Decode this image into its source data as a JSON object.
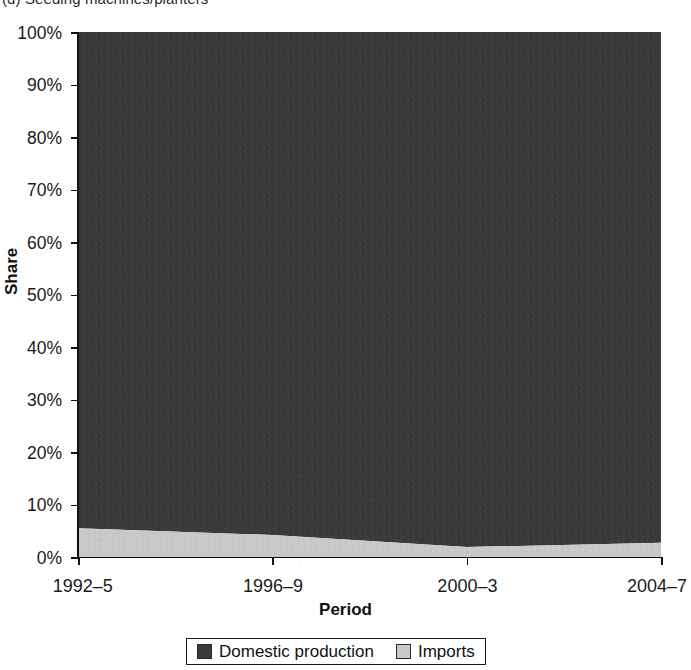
{
  "chart_data": {
    "type": "area",
    "stacked": true,
    "normalized": true,
    "title": "(d) Seeding machines/planters",
    "xlabel": "Period",
    "ylabel": "Share",
    "categories": [
      "1992–5",
      "1996–9",
      "2000–3",
      "2004–7"
    ],
    "series": [
      {
        "name": "Domestic production",
        "values": [
          94.5,
          95.8,
          98.1,
          97.3
        ],
        "color": "#3a3a3a"
      },
      {
        "name": "Imports",
        "values": [
          5.5,
          4.2,
          1.9,
          2.7
        ],
        "color": "#c8c8c8"
      }
    ],
    "ylim": [
      0,
      100
    ],
    "ytick_labels": [
      "0%",
      "10%",
      "20%",
      "30%",
      "40%",
      "50%",
      "60%",
      "70%",
      "80%",
      "90%",
      "100%"
    ],
    "ytick_values": [
      0,
      10,
      20,
      30,
      40,
      50,
      60,
      70,
      80,
      90,
      100
    ],
    "grid": false,
    "legend_position": "bottom",
    "legend_entries": [
      "Domestic production",
      "Imports"
    ]
  },
  "colors": {
    "domestic_production": "#3a3a3a",
    "imports": "#c8c8c8",
    "axis": "#111111",
    "background": "#ffffff"
  }
}
